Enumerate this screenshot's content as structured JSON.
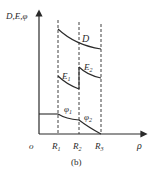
{
  "figure": {
    "caption": "(b)",
    "y_axis_label": "D,E,φ",
    "x_axis_label": "ρ",
    "origin_label": "o",
    "radii": [
      {
        "name": "R",
        "sub": "1"
      },
      {
        "name": "R",
        "sub": "2"
      },
      {
        "name": "R",
        "sub": "3"
      }
    ],
    "curves": {
      "D": {
        "name": "D"
      },
      "E1": {
        "name": "E",
        "sub": "1"
      },
      "E2": {
        "name": "E",
        "sub": "2"
      },
      "phi1": {
        "name": "φ",
        "sub": "1"
      },
      "phi2": {
        "name": "φ",
        "sub": "2"
      }
    },
    "colors": {
      "line": "#2a2a2a",
      "background": "#ffffff"
    }
  }
}
